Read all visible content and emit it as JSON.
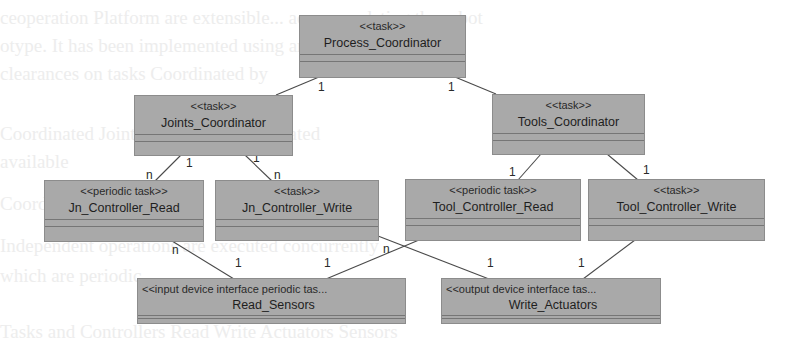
{
  "background_bleed": [
    "ceoperation Platform are extensible...   accommodating the robot",
    "otype. It has been implemented          using an SGT with the",
    "clearances on tasks Coordinated  by",
    "Coordinated   Joints and Tools   Coordinated",
    "available",
    "          Coordinated             tasks",
    "Independent  operations  are  executed concurrently",
    "            which are                     periodic",
    "Tasks and Controllers Read    Write          Actuators  Sensors"
  ],
  "classes": [
    {
      "id": "process_coordinator",
      "stereotype": "<<task>>",
      "name": "Process_Coordinator"
    },
    {
      "id": "joints_coordinator",
      "stereotype": "<<task>>",
      "name": "Joints_Coordinator"
    },
    {
      "id": "tools_coordinator",
      "stereotype": "<<task>>",
      "name": "Tools_Coordinator"
    },
    {
      "id": "jn_controller_read",
      "stereotype": "<<periodic task>>",
      "name": "Jn_Controller_Read"
    },
    {
      "id": "jn_controller_write",
      "stereotype": "<<task>>",
      "name": "Jn_Controller_Write"
    },
    {
      "id": "tool_controller_read",
      "stereotype": "<<periodic task>>",
      "name": "Tool_Controller_Read"
    },
    {
      "id": "tool_controller_write",
      "stereotype": "<<task>>",
      "name": "Tool_Controller_Write"
    },
    {
      "id": "read_sensors",
      "stereotype": "<<input device interface periodic tas...",
      "name": "Read_Sensors"
    },
    {
      "id": "write_actuators",
      "stereotype": "<<output device interface tas...",
      "name": "Write_Actuators"
    }
  ],
  "associations": [
    {
      "from": "Process_Coordinator",
      "to": "Joints_Coordinator",
      "from_mult": "1",
      "to_mult": ""
    },
    {
      "from": "Process_Coordinator",
      "to": "Tools_Coordinator",
      "from_mult": "1",
      "to_mult": ""
    },
    {
      "from": "Joints_Coordinator",
      "to": "Jn_Controller_Read",
      "from_mult": "1",
      "to_mult": "n"
    },
    {
      "from": "Joints_Coordinator",
      "to": "Jn_Controller_Write",
      "from_mult": "1",
      "to_mult": "n"
    },
    {
      "from": "Tools_Coordinator",
      "to": "Tool_Controller_Read",
      "from_mult": "",
      "to_mult": "1"
    },
    {
      "from": "Tools_Coordinator",
      "to": "Tool_Controller_Write",
      "from_mult": "",
      "to_mult": "1"
    },
    {
      "from": "Jn_Controller_Read",
      "to": "Read_Sensors",
      "from_mult": "n",
      "to_mult": "1"
    },
    {
      "from": "Tool_Controller_Read",
      "to": "Read_Sensors",
      "from_mult": "",
      "to_mult": "1"
    },
    {
      "from": "Jn_Controller_Write",
      "to": "Write_Actuators",
      "from_mult": "n",
      "to_mult": "1"
    },
    {
      "from": "Tool_Controller_Write",
      "to": "Write_Actuators",
      "from_mult": "",
      "to_mult": "1"
    }
  ],
  "multiplicity_labels": {
    "pc_jc": "1",
    "pc_tc": "1",
    "jc_jcr_src": "1",
    "jc_jcr_dst": "n",
    "jc_jcw_src": "1",
    "jc_jcw_dst": "n",
    "tc_tcr_dst": "1",
    "tc_tcw_dst": "1",
    "jcr_rs_src": "n",
    "jcr_rs_dst": "1",
    "tcr_rs_dst": "1",
    "jcw_wa_src": "n",
    "jcw_wa_dst": "1",
    "tcw_wa_dst": "1"
  },
  "colors": {
    "class_fill": "#a9a9a9",
    "class_border": "#8c8c8c",
    "divider": "#767676",
    "link": "#4a4a4a",
    "background": "#ffffff"
  }
}
